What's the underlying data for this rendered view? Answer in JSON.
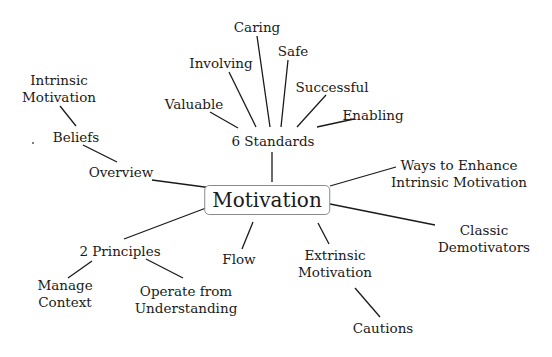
{
  "mindmap": {
    "root": {
      "id": "motivation",
      "label": "Motivation"
    },
    "nodes": [
      {
        "id": "six-standards",
        "parent": "motivation",
        "lines": [
          "6 Standards"
        ]
      },
      {
        "id": "valuable",
        "parent": "six-standards",
        "lines": [
          "Valuable"
        ]
      },
      {
        "id": "involving",
        "parent": "six-standards",
        "lines": [
          "Involving"
        ]
      },
      {
        "id": "caring",
        "parent": "six-standards",
        "lines": [
          "Caring"
        ]
      },
      {
        "id": "safe",
        "parent": "six-standards",
        "lines": [
          "Safe"
        ]
      },
      {
        "id": "successful",
        "parent": "six-standards",
        "lines": [
          "Successful"
        ]
      },
      {
        "id": "enabling",
        "parent": "six-standards",
        "lines": [
          "Enabling"
        ]
      },
      {
        "id": "overview",
        "parent": "motivation",
        "lines": [
          "Overview"
        ]
      },
      {
        "id": "beliefs",
        "parent": "overview",
        "lines": [
          "Beliefs"
        ]
      },
      {
        "id": "intrinsic-motivation",
        "parent": "beliefs",
        "lines": [
          "Intrinsic",
          "Motivation"
        ]
      },
      {
        "id": "ways-to-enhance",
        "parent": "motivation",
        "lines": [
          "Ways to Enhance",
          "Intrinsic Motivation"
        ]
      },
      {
        "id": "classic-demotivators",
        "parent": "motivation",
        "lines": [
          "Classic",
          "Demotivators"
        ]
      },
      {
        "id": "extrinsic-motivation",
        "parent": "motivation",
        "lines": [
          "Extrinsic",
          "Motivation"
        ]
      },
      {
        "id": "cautions",
        "parent": "extrinsic-motivation",
        "lines": [
          "Cautions"
        ]
      },
      {
        "id": "flow",
        "parent": "motivation",
        "lines": [
          "Flow"
        ]
      },
      {
        "id": "two-principles",
        "parent": "motivation",
        "lines": [
          "2 Principles"
        ]
      },
      {
        "id": "manage-context",
        "parent": "two-principles",
        "lines": [
          "Manage",
          "Context"
        ]
      },
      {
        "id": "operate-from-understanding",
        "parent": "two-principles",
        "lines": [
          "Operate from",
          "Understanding"
        ]
      }
    ]
  }
}
